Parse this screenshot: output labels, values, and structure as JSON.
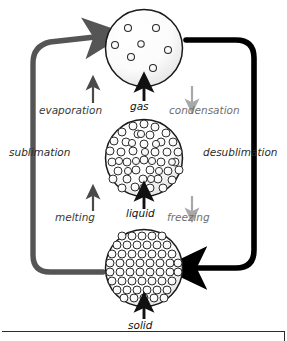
{
  "diagram": {
    "states": [
      {
        "id": "gas",
        "label": "gas",
        "particle_count": 7,
        "arrangement": "sparse-random"
      },
      {
        "id": "liquid",
        "label": "liquid",
        "particle_count": 60,
        "arrangement": "dense-irregular"
      },
      {
        "id": "solid",
        "label": "solid",
        "particle_count": 72,
        "arrangement": "regular-lattice"
      }
    ],
    "transitions": [
      {
        "id": "evaporation",
        "label": "evaporation",
        "from": "liquid",
        "to": "gas",
        "direction": "up",
        "energy": "absorbs",
        "color": "#4a4a4a"
      },
      {
        "id": "condensation",
        "label": "condensation",
        "from": "gas",
        "to": "liquid",
        "direction": "down",
        "energy": "releases",
        "color": "#a8a8a8"
      },
      {
        "id": "melting",
        "label": "melting",
        "from": "solid",
        "to": "liquid",
        "direction": "up",
        "energy": "absorbs",
        "color": "#4a4a4a"
      },
      {
        "id": "freezing",
        "label": "freezing",
        "from": "liquid",
        "to": "solid",
        "direction": "down",
        "energy": "releases",
        "color": "#a8a8a8"
      },
      {
        "id": "sublimation",
        "label": "sublimation",
        "from": "solid",
        "to": "gas",
        "direction": "up",
        "energy": "absorbs",
        "color": "#555555"
      },
      {
        "id": "desublimation",
        "label": "desublimation",
        "from": "gas",
        "to": "solid",
        "direction": "down",
        "energy": "releases",
        "color": "#000000"
      }
    ],
    "center_arrows": [
      {
        "id": "arrow-to-gas",
        "points_to": "gas",
        "color": "#111111"
      },
      {
        "id": "arrow-to-liquid",
        "points_to": "liquid",
        "color": "#111111"
      },
      {
        "id": "arrow-to-solid",
        "points_to": "solid",
        "color": "#111111"
      }
    ],
    "colors": {
      "black": "#111111",
      "dark_gray": "#4a4a4a",
      "light_gray": "#a8a8a8",
      "circle_outline": "#1a1a1a",
      "background": "#ffffff"
    }
  }
}
